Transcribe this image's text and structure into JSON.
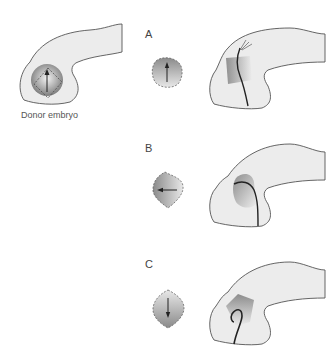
{
  "donor": {
    "caption": "Donor embryo"
  },
  "panels": [
    {
      "label": "A",
      "graft_orientation": "up"
    },
    {
      "label": "B",
      "graft_orientation": "left"
    },
    {
      "label": "C",
      "graft_orientation": "down"
    }
  ],
  "colors": {
    "embryo_fill": "#ececec",
    "embryo_stroke": "#555555",
    "graft_dark": "#8a8a8a",
    "graft_light": "#e6e6e6",
    "nerve": "#222222"
  }
}
